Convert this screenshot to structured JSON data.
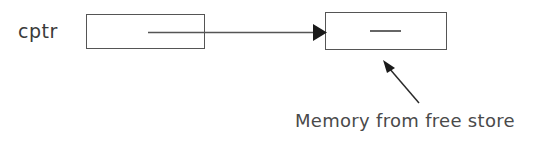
{
  "diagram": {
    "variable_label": "cptr",
    "caption": "Memory from free store",
    "boxes": [
      {
        "name": "pointer-variable-box",
        "content": ""
      },
      {
        "name": "heap-memory-box",
        "content": ""
      }
    ],
    "colors": {
      "background": "#ffffff",
      "stroke": "#555555",
      "text": "#3a3a3a",
      "caption_text": "#4a4a4a"
    }
  }
}
